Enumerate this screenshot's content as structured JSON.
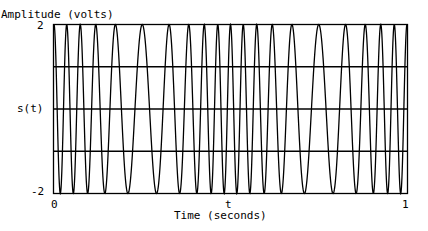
{
  "chart_data": {
    "type": "line",
    "title": "",
    "ylabel": "Amplitude (volts)",
    "xlabel": "Time (seconds)",
    "y_side_label": "s(t)",
    "x_center_label": "t",
    "xlim": [
      0,
      1
    ],
    "ylim": [
      -2,
      2
    ],
    "x_ticks": [
      "0",
      "1"
    ],
    "y_ticks": [
      "2",
      "-2"
    ],
    "grid_y": [
      -1,
      0,
      1
    ],
    "series": [
      {
        "name": "s(t)",
        "description": "frequency-modulated sinusoid, amplitude 2 V, ~20 cycles over 1 s; faster oscillation near t=0, 0.5, 1 and slower near t=0.25, 0.75",
        "amplitude": 2,
        "carrier_hz": 20,
        "deviation_hz": 8,
        "modulation_hz": 2,
        "peak_times": [
          0,
          0.034,
          0.073,
          0.124,
          0.181,
          0.249,
          0.316,
          0.373,
          0.415,
          0.458,
          0.497,
          0.537,
          0.576,
          0.624,
          0.678,
          0.746,
          0.814,
          0.87,
          0.915,
          0.958,
          1.0
        ]
      }
    ],
    "legend": null
  },
  "labels": {
    "ylabel": "Amplitude (volts)",
    "ytick_top": "2",
    "ytick_bottom": "-2",
    "side": "s(t)",
    "xtick_left": "0",
    "xtick_right": "1",
    "xcenter": "t",
    "xlabel": "Time (seconds)"
  }
}
